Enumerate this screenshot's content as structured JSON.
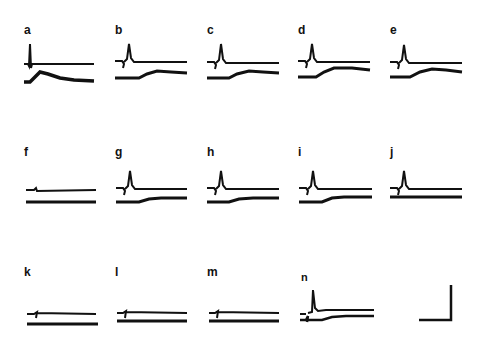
{
  "figure": {
    "panels": [
      {
        "label": "a",
        "x": 24,
        "y": 24,
        "trace_y": 40,
        "spike": "tall",
        "lower": "early-large"
      },
      {
        "label": "b",
        "x": 115,
        "y": 24,
        "trace_y": 40,
        "spike": "medium",
        "lower": "mid"
      },
      {
        "label": "c",
        "x": 207,
        "y": 24,
        "trace_y": 40,
        "spike": "medium",
        "lower": "mid"
      },
      {
        "label": "d",
        "x": 298,
        "y": 24,
        "trace_y": 40,
        "spike": "medium",
        "lower": "mid"
      },
      {
        "label": "e",
        "x": 390,
        "y": 24,
        "trace_y": 40,
        "spike": "medium",
        "lower": "mid"
      },
      {
        "label": "f",
        "x": 24,
        "y": 146,
        "trace_y": 32,
        "spike": "none",
        "lower": "flat"
      },
      {
        "label": "g",
        "x": 115,
        "y": 146,
        "trace_y": 32,
        "spike": "medium",
        "lower": "small"
      },
      {
        "label": "h",
        "x": 207,
        "y": 146,
        "trace_y": 32,
        "spike": "medium",
        "lower": "small"
      },
      {
        "label": "i",
        "x": 298,
        "y": 146,
        "trace_y": 32,
        "spike": "medium",
        "lower": "small"
      },
      {
        "label": "j",
        "x": 390,
        "y": 146,
        "trace_y": 32,
        "spike": "medium",
        "lower": "flat"
      },
      {
        "label": "k",
        "x": 24,
        "y": 266,
        "trace_y": 38,
        "spike": "none",
        "lower": "flat"
      },
      {
        "label": "l",
        "x": 115,
        "y": 266,
        "trace_y": 38,
        "spike": "none",
        "lower": "flat"
      },
      {
        "label": "m",
        "x": 207,
        "y": 266,
        "trace_y": 38,
        "spike": "none",
        "lower": "flat"
      },
      {
        "label": "n",
        "x": 298,
        "y": 266,
        "trace_y": 38,
        "spike": "tall-late",
        "lower": "converge"
      }
    ],
    "scale_bar": {
      "label": "",
      "color": "#111111"
    },
    "trace_color": "#111111"
  }
}
